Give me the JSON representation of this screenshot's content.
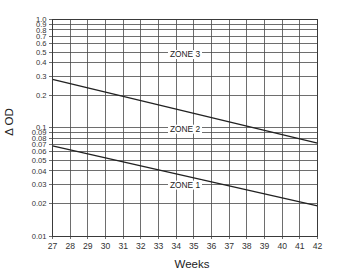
{
  "chart_data": {
    "type": "line",
    "title": "",
    "xlabel": "Weeks",
    "ylabel": "Δ OD",
    "x_scale": "linear",
    "y_scale": "log",
    "xlim": [
      27,
      42
    ],
    "ylim": [
      0.01,
      1.0
    ],
    "grid": true,
    "x_ticks": [
      27,
      28,
      29,
      30,
      31,
      32,
      33,
      34,
      35,
      36,
      37,
      38,
      39,
      40,
      41,
      42
    ],
    "y_ticks": [
      {
        "value": 1.0,
        "label": "1.0"
      },
      {
        "value": 0.9,
        "label": "0.9"
      },
      {
        "value": 0.8,
        "label": "0.8"
      },
      {
        "value": 0.7,
        "label": "0.7"
      },
      {
        "value": 0.6,
        "label": "0.6"
      },
      {
        "value": 0.5,
        "label": "0.5"
      },
      {
        "value": 0.4,
        "label": "0.4"
      },
      {
        "value": 0.3,
        "label": "0.3"
      },
      {
        "value": 0.2,
        "label": "0.2"
      },
      {
        "value": 0.1,
        "label": "0.1"
      },
      {
        "value": 0.09,
        "label": "0.09"
      },
      {
        "value": 0.08,
        "label": "0.08"
      },
      {
        "value": 0.07,
        "label": "0.07"
      },
      {
        "value": 0.06,
        "label": "0.06"
      },
      {
        "value": 0.05,
        "label": "0.05"
      },
      {
        "value": 0.04,
        "label": "0.04"
      },
      {
        "value": 0.03,
        "label": "0.03"
      },
      {
        "value": 0.02,
        "label": "0.02"
      },
      {
        "value": 0.01,
        "label": "0.01"
      }
    ],
    "series": [
      {
        "name": "Zone 2/3 boundary",
        "x": [
          27,
          42
        ],
        "y": [
          0.28,
          0.072
        ]
      },
      {
        "name": "Zone 1/2 boundary",
        "x": [
          27,
          42
        ],
        "y": [
          0.068,
          0.019
        ]
      }
    ],
    "annotations": [
      {
        "text": "ZONE 3",
        "x": 34.5,
        "y": 0.45
      },
      {
        "text": "ZONE 2",
        "x": 34.5,
        "y": 0.092
      },
      {
        "text": "ZONE 1",
        "x": 34.5,
        "y": 0.028
      }
    ],
    "legend": "none"
  }
}
